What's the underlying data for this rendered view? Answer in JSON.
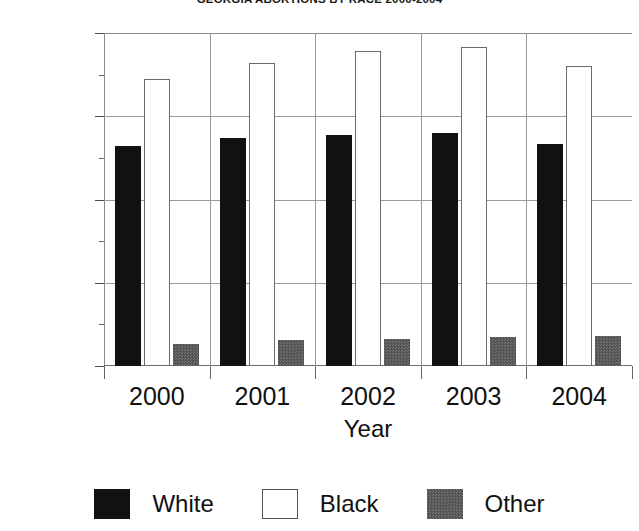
{
  "chart_data": {
    "type": "bar",
    "title": "GEORGIA ABORTIONS BY RACE 2000-2004",
    "xlabel": "Year",
    "ylabel": "",
    "categories": [
      "2000",
      "2001",
      "2002",
      "2003",
      "2004"
    ],
    "series": [
      {
        "name": "White",
        "color": "#111111",
        "values": [
          13200,
          13700,
          13900,
          14000,
          13350
        ]
      },
      {
        "name": "Black",
        "color": "#ffffff",
        "values": [
          17250,
          18200,
          18900,
          19150,
          18000
        ]
      },
      {
        "name": "Other",
        "color": "#555555",
        "values": [
          1350,
          1550,
          1600,
          1750,
          1800
        ]
      }
    ],
    "ylim": [
      0,
      20000
    ],
    "yticks": [
      0,
      5000,
      10000,
      15000,
      20000
    ],
    "ytick_labels": [
      "0",
      "5000",
      "10000",
      "15000",
      "20000"
    ],
    "yminor_step": 2500,
    "grid": true,
    "legend_position": "bottom"
  },
  "axis": {
    "y_label_0": "0",
    "y_label_1": "5000",
    "y_label_2": "10000",
    "y_label_3": "15000",
    "y_label_4": "20000",
    "x_label_0": "2000",
    "x_label_1": "2001",
    "x_label_2": "2002",
    "x_label_3": "2003",
    "x_label_4": "2004",
    "x_title": "Year"
  },
  "legend": {
    "items": [
      {
        "label": "White"
      },
      {
        "label": "Black"
      },
      {
        "label": "Other"
      }
    ]
  }
}
